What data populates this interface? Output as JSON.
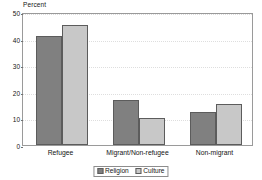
{
  "chart_data": {
    "type": "bar",
    "title": "",
    "subtitle": "",
    "xlabel": "",
    "ylabel": "Percent",
    "ylim": [
      0,
      50
    ],
    "yticks": [
      0,
      10,
      20,
      30,
      40,
      50
    ],
    "ytick_labels": [
      "0",
      "10",
      "20",
      "30",
      "40",
      "50"
    ],
    "grid": true,
    "grid_style": "dotted-horizontal",
    "legend_position": "bottom-center",
    "categories": [
      "Refugee",
      "Migrant/Non-refugee",
      "Non-migrant"
    ],
    "series": [
      {
        "name": "Religion",
        "color": "#808080",
        "values": [
          41,
          17,
          12.5
        ]
      },
      {
        "name": "Culture",
        "color": "#c8c8c8",
        "values": [
          45,
          10,
          15.5
        ]
      }
    ]
  },
  "colors": {
    "background": "#ffffff",
    "frame": "#9a9a9a",
    "gridline": "#dedede",
    "bar_outline": "#5c5c5c",
    "text": "#141414",
    "series_religion": "#808080",
    "series_culture": "#c8c8c8"
  }
}
